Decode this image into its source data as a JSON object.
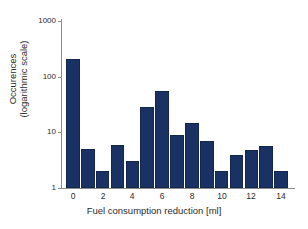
{
  "chart_data": {
    "type": "bar",
    "title": "",
    "xlabel": "Fuel consumption reduction [ml]",
    "ylabel_line1": "Occurences",
    "ylabel_line2": "(logarithmic scale)",
    "yscale": "log",
    "ylim": [
      1,
      1000
    ],
    "xlim": [
      -0.8,
      14.8
    ],
    "grid": false,
    "legend": null,
    "bar_color": "#1a3263",
    "bar_edge_color": "#14264d",
    "axis_color": "#8c8c8c",
    "ytick_labels": [
      "1000",
      "100",
      "10",
      "1"
    ],
    "ytick_values": [
      1000,
      100,
      10,
      1
    ],
    "xtick_labels": [
      "0",
      "2",
      "4",
      "6",
      "8",
      "10",
      "12",
      "14"
    ],
    "xtick_values": [
      0,
      2,
      4,
      6,
      8,
      10,
      12,
      14
    ],
    "categories": [
      0,
      1,
      2,
      3,
      4,
      5,
      6,
      7,
      8,
      9,
      10,
      11,
      12,
      13,
      14
    ],
    "values": [
      210,
      5,
      2,
      6,
      3,
      29,
      55,
      9,
      15,
      7,
      2,
      4,
      4.8,
      5.7,
      2
    ]
  }
}
